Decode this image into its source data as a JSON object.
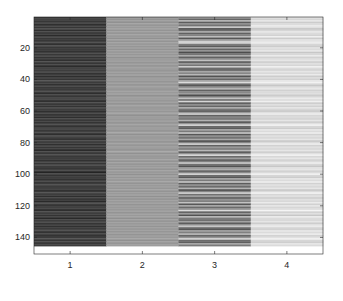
{
  "chart_data": {
    "type": "heatmap",
    "title": "",
    "xlabel": "",
    "ylabel": "",
    "colormap": "gray",
    "rows": 150,
    "cols": 4,
    "x_ticks": [
      1,
      2,
      3,
      4
    ],
    "x_tick_labels": [
      "1",
      "2",
      "3",
      "4"
    ],
    "y_ticks": [
      20,
      40,
      60,
      80,
      100,
      120,
      140
    ],
    "y_tick_labels": [
      "20",
      "40",
      "60",
      "80",
      "100",
      "120",
      "140"
    ],
    "xlim": [
      0.5,
      4.5
    ],
    "ylim": [
      0.5,
      150.5
    ],
    "y_direction": "reverse",
    "grid": false,
    "legend": false,
    "column_value_ranges": [
      {
        "column": 1,
        "min": 0.14,
        "max": 0.34,
        "typical": 0.24
      },
      {
        "column": 2,
        "min": 0.52,
        "max": 0.7,
        "typical": 0.6
      },
      {
        "column": 3,
        "min": 0.28,
        "max": 0.88,
        "typical": 0.55
      },
      {
        "column": 4,
        "min": 0.72,
        "max": 0.97,
        "typical": 0.85
      }
    ],
    "values": [
      [
        0.22,
        0.6,
        0.62,
        0.88
      ],
      [
        0.26,
        0.58,
        0.4,
        0.84
      ],
      [
        0.2,
        0.61,
        0.7,
        0.9
      ],
      [
        0.28,
        0.57,
        0.36,
        0.8
      ],
      [
        0.18,
        0.62,
        0.55,
        0.86
      ],
      [
        0.24,
        0.59,
        0.45,
        0.92
      ],
      [
        0.21,
        0.6,
        0.78,
        0.88
      ],
      [
        0.3,
        0.63,
        0.32,
        0.78
      ],
      [
        0.19,
        0.58,
        0.42,
        0.84
      ],
      [
        0.25,
        0.61,
        0.66,
        0.9
      ],
      [
        0.23,
        0.59,
        0.38,
        0.86
      ],
      [
        0.17,
        0.62,
        0.5,
        0.82
      ],
      [
        0.27,
        0.6,
        0.74,
        0.94
      ],
      [
        0.22,
        0.57,
        0.34,
        0.8
      ],
      [
        0.2,
        0.63,
        0.58,
        0.88
      ],
      [
        0.26,
        0.58,
        0.82,
        0.9
      ],
      [
        0.24,
        0.61,
        0.8,
        0.92
      ],
      [
        0.19,
        0.6,
        0.48,
        0.84
      ],
      [
        0.29,
        0.59,
        0.36,
        0.8
      ],
      [
        0.21,
        0.62,
        0.64,
        0.88
      ],
      [
        0.23,
        0.58,
        0.4,
        0.86
      ],
      [
        0.18,
        0.61,
        0.56,
        0.9
      ],
      [
        0.25,
        0.6,
        0.3,
        0.78
      ],
      [
        0.22,
        0.59,
        0.44,
        0.84
      ],
      [
        0.28,
        0.63,
        0.68,
        0.92
      ],
      [
        0.2,
        0.57,
        0.38,
        0.82
      ],
      [
        0.24,
        0.6,
        0.52,
        0.86
      ],
      [
        0.19,
        0.62,
        0.76,
        0.9
      ],
      [
        0.27,
        0.58,
        0.34,
        0.8
      ],
      [
        0.21,
        0.61,
        0.6,
        0.88
      ],
      [
        0.23,
        0.59,
        0.46,
        0.84
      ],
      [
        0.17,
        0.6,
        0.8,
        0.94
      ],
      [
        0.26,
        0.62,
        0.42,
        0.86
      ],
      [
        0.22,
        0.58,
        0.36,
        0.82
      ],
      [
        0.29,
        0.61,
        0.66,
        0.9
      ],
      [
        0.2,
        0.59,
        0.5,
        0.84
      ],
      [
        0.24,
        0.63,
        0.72,
        0.92
      ],
      [
        0.18,
        0.57,
        0.32,
        0.8
      ],
      [
        0.25,
        0.6,
        0.56,
        0.86
      ],
      [
        0.21,
        0.62,
        0.4,
        0.82
      ],
      [
        0.3,
        0.58,
        0.64,
        0.9
      ],
      [
        0.23,
        0.61,
        0.86,
        0.95
      ],
      [
        0.19,
        0.59,
        0.44,
        0.84
      ],
      [
        0.26,
        0.6,
        0.34,
        0.78
      ],
      [
        0.22,
        0.62,
        0.58,
        0.88
      ],
      [
        0.2,
        0.58,
        0.7,
        0.9
      ],
      [
        0.27,
        0.61,
        0.38,
        0.82
      ],
      [
        0.24,
        0.6,
        0.52,
        0.86
      ],
      [
        0.18,
        0.63,
        0.62,
        0.88
      ],
      [
        0.25,
        0.57,
        0.3,
        0.8
      ],
      [
        0.21,
        0.6,
        0.48,
        0.84
      ],
      [
        0.28,
        0.62,
        0.76,
        0.92
      ],
      [
        0.23,
        0.59,
        0.42,
        0.86
      ],
      [
        0.19,
        0.61,
        0.84,
        0.94
      ],
      [
        0.26,
        0.58,
        0.36,
        0.8
      ],
      [
        0.22,
        0.6,
        0.56,
        0.88
      ],
      [
        0.2,
        0.62,
        0.4,
        0.82
      ],
      [
        0.29,
        0.59,
        0.68,
        0.9
      ],
      [
        0.24,
        0.61,
        0.46,
        0.84
      ],
      [
        0.17,
        0.58,
        0.34,
        0.78
      ],
      [
        0.25,
        0.63,
        0.6,
        0.88
      ],
      [
        0.21,
        0.6,
        0.78,
        0.92
      ],
      [
        0.23,
        0.57,
        0.38,
        0.84
      ],
      [
        0.18,
        0.61,
        0.52,
        0.86
      ],
      [
        0.27,
        0.59,
        0.44,
        0.82
      ],
      [
        0.22,
        0.62,
        0.7,
        0.9
      ],
      [
        0.2,
        0.58,
        0.32,
        0.8
      ],
      [
        0.26,
        0.6,
        0.58,
        0.88
      ],
      [
        0.24,
        0.61,
        0.82,
        0.94
      ],
      [
        0.19,
        0.59,
        0.4,
        0.84
      ],
      [
        0.28,
        0.62,
        0.36,
        0.8
      ],
      [
        0.21,
        0.58,
        0.64,
        0.9
      ],
      [
        0.25,
        0.6,
        0.48,
        0.86
      ],
      [
        0.23,
        0.63,
        0.74,
        0.92
      ],
      [
        0.18,
        0.57,
        0.34,
        0.82
      ],
      [
        0.3,
        0.61,
        0.56,
        0.88
      ],
      [
        0.22,
        0.59,
        0.42,
        0.84
      ],
      [
        0.2,
        0.62,
        0.66,
        0.9
      ],
      [
        0.26,
        0.58,
        0.3,
        0.78
      ],
      [
        0.24,
        0.6,
        0.52,
        0.86
      ],
      [
        0.19,
        0.61,
        0.8,
        0.92
      ],
      [
        0.27,
        0.59,
        0.38,
        0.82
      ],
      [
        0.21,
        0.62,
        0.6,
        0.88
      ],
      [
        0.23,
        0.58,
        0.46,
        0.84
      ],
      [
        0.17,
        0.6,
        0.72,
        0.9
      ],
      [
        0.25,
        0.63,
        0.34,
        0.8
      ],
      [
        0.22,
        0.57,
        0.56,
        0.88
      ],
      [
        0.28,
        0.61,
        0.84,
        0.94
      ],
      [
        0.2,
        0.59,
        0.4,
        0.84
      ],
      [
        0.24,
        0.6,
        0.62,
        0.9
      ],
      [
        0.18,
        0.62,
        0.36,
        0.82
      ],
      [
        0.26,
        0.58,
        0.5,
        0.86
      ],
      [
        0.21,
        0.61,
        0.76,
        0.92
      ],
      [
        0.29,
        0.59,
        0.44,
        0.84
      ],
      [
        0.23,
        0.6,
        0.32,
        0.78
      ],
      [
        0.19,
        0.62,
        0.58,
        0.88
      ],
      [
        0.25,
        0.58,
        0.68,
        0.9
      ],
      [
        0.22,
        0.61,
        0.38,
        0.82
      ],
      [
        0.14,
        0.6,
        0.54,
        0.86
      ],
      [
        0.27,
        0.57,
        0.82,
        0.94
      ],
      [
        0.2,
        0.63,
        0.42,
        0.84
      ],
      [
        0.24,
        0.59,
        0.34,
        0.8
      ],
      [
        0.18,
        0.61,
        0.64,
        0.9
      ],
      [
        0.26,
        0.6,
        0.48,
        0.86
      ],
      [
        0.21,
        0.62,
        0.74,
        0.92
      ],
      [
        0.23,
        0.58,
        0.36,
        0.82
      ],
      [
        0.28,
        0.6,
        0.56,
        0.88
      ],
      [
        0.2,
        0.61,
        0.4,
        0.84
      ],
      [
        0.25,
        0.59,
        0.7,
        0.9
      ],
      [
        0.19,
        0.62,
        0.3,
        0.78
      ],
      [
        0.22,
        0.58,
        0.52,
        0.86
      ],
      [
        0.27,
        0.6,
        0.8,
        0.94
      ],
      [
        0.24,
        0.63,
        0.44,
        0.84
      ],
      [
        0.18,
        0.57,
        0.62,
        0.88
      ],
      [
        0.26,
        0.61,
        0.36,
        0.8
      ],
      [
        0.21,
        0.59,
        0.58,
        0.88
      ],
      [
        0.15,
        0.6,
        0.46,
        0.84
      ],
      [
        0.29,
        0.62,
        0.76,
        0.92
      ],
      [
        0.23,
        0.58,
        0.34,
        0.82
      ],
      [
        0.2,
        0.61,
        0.66,
        0.9
      ],
      [
        0.25,
        0.6,
        0.42,
        0.84
      ],
      [
        0.22,
        0.59,
        0.54,
        0.86
      ],
      [
        0.18,
        0.62,
        0.86,
        0.96
      ],
      [
        0.27,
        0.58,
        0.38,
        0.82
      ],
      [
        0.24,
        0.61,
        0.6,
        0.88
      ],
      [
        0.2,
        0.6,
        0.32,
        0.78
      ],
      [
        0.26,
        0.63,
        0.72,
        0.92
      ],
      [
        0.16,
        0.57,
        0.48,
        0.86
      ],
      [
        0.23,
        0.61,
        0.4,
        0.84
      ],
      [
        0.28,
        0.59,
        0.64,
        0.9
      ],
      [
        0.21,
        0.6,
        0.36,
        0.8
      ],
      [
        0.25,
        0.62,
        0.56,
        0.88
      ],
      [
        0.19,
        0.58,
        0.78,
        0.92
      ],
      [
        0.22,
        0.61,
        0.44,
        0.84
      ],
      [
        0.27,
        0.6,
        0.34,
        0.82
      ],
      [
        0.24,
        0.59,
        0.62,
        0.9
      ],
      [
        0.2,
        0.62,
        0.5,
        0.86
      ],
      [
        0.26,
        0.58,
        0.7,
        0.92
      ],
      [
        0.18,
        0.61,
        0.38,
        0.82
      ],
      [
        0.23,
        0.6,
        0.58,
        0.88
      ],
      [
        0.29,
        0.63,
        0.82,
        0.94
      ],
      [
        0.21,
        0.57,
        0.42,
        0.84
      ],
      [
        0.25,
        0.61,
        0.36,
        0.8
      ],
      [
        0.22,
        0.59,
        0.66,
        0.9
      ],
      [
        0.24,
        0.62,
        0.48,
        0.86
      ]
    ]
  },
  "axes": {
    "x_tick_labels": [
      "1",
      "2",
      "3",
      "4"
    ],
    "y_tick_labels": [
      "20",
      "40",
      "60",
      "80",
      "100",
      "120",
      "140"
    ]
  }
}
